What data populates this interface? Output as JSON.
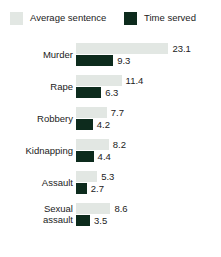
{
  "chart_data": {
    "type": "bar",
    "orientation": "horizontal",
    "grouped": true,
    "title": "",
    "subtitle": "",
    "xlabel": "",
    "ylabel": "",
    "grid": false,
    "legend_position": "top",
    "xlim": [
      0,
      23.1
    ],
    "categories": [
      "Murder",
      "Rape",
      "Robbery",
      "Kidnapping",
      "Assault",
      "Sexual assault"
    ],
    "series": [
      {
        "name": "Average sentence",
        "color": "#e2e7e3",
        "values": [
          23.1,
          11.4,
          7.7,
          8.2,
          5.3,
          8.6
        ]
      },
      {
        "name": "Time served",
        "color": "#0d2b1d",
        "values": [
          9.3,
          6.3,
          4.2,
          4.4,
          2.7,
          3.5
        ]
      }
    ]
  },
  "legend": {
    "items": [
      {
        "label": "Average sentence",
        "swatch": "light"
      },
      {
        "label": "Time served",
        "swatch": "dark"
      }
    ]
  },
  "groups": [
    {
      "label": "Murder",
      "label_lines": [
        "Murder"
      ],
      "average_sentence": "23.1",
      "time_served": "9.3"
    },
    {
      "label": "Rape",
      "label_lines": [
        "Rape"
      ],
      "average_sentence": "11.4",
      "time_served": "6.3"
    },
    {
      "label": "Robbery",
      "label_lines": [
        "Robbery"
      ],
      "average_sentence": "7.7",
      "time_served": "4.2"
    },
    {
      "label": "Kidnapping",
      "label_lines": [
        "Kidnapping"
      ],
      "average_sentence": "8.2",
      "time_served": "4.4"
    },
    {
      "label": "Assault",
      "label_lines": [
        "Assault"
      ],
      "average_sentence": "5.3",
      "time_served": "2.7"
    },
    {
      "label": "Sexual assault",
      "label_lines": [
        "Sexual",
        "assault"
      ],
      "average_sentence": "8.6",
      "time_served": "3.5"
    }
  ]
}
